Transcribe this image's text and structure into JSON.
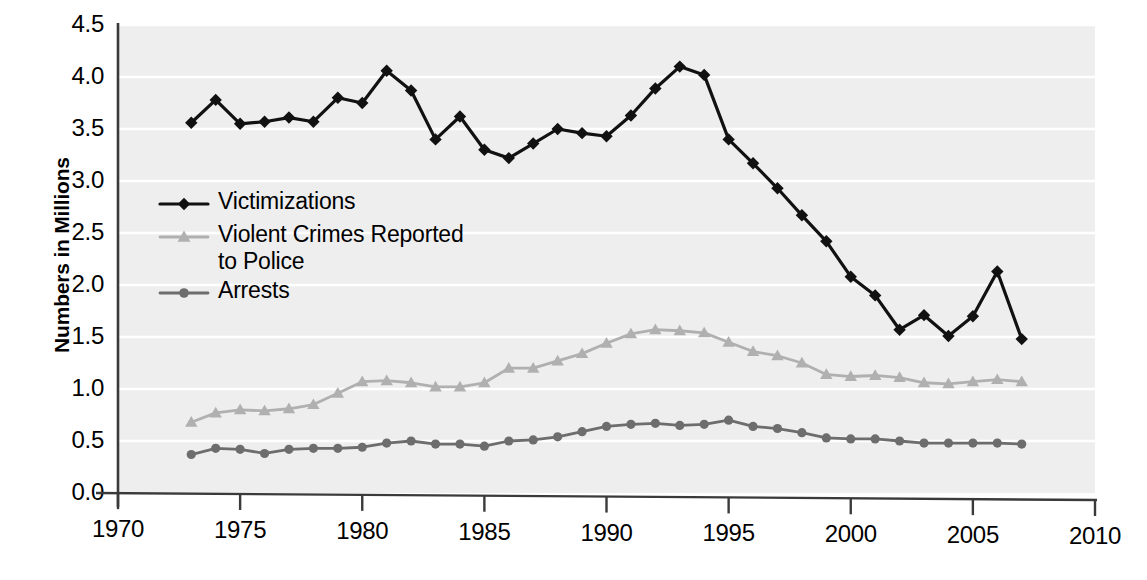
{
  "chart_data": {
    "type": "line",
    "title": "",
    "xlabel": "",
    "ylabel": "Numbers in Millions",
    "xlim": [
      1970,
      2010
    ],
    "ylim": [
      0.0,
      4.5
    ],
    "grid": true,
    "legend_position": "inside-left",
    "y_ticks": [
      "0.0",
      "0.5",
      "1.0",
      "1.5",
      "2.0",
      "2.5",
      "3.0",
      "3.5",
      "4.0",
      "4.5"
    ],
    "y_tick_values": [
      0.0,
      0.5,
      1.0,
      1.5,
      2.0,
      2.5,
      3.0,
      3.5,
      4.0,
      4.5
    ],
    "x_ticks": [
      "1970",
      "1975",
      "1980",
      "1985",
      "1990",
      "1995",
      "2000",
      "2005",
      "2010"
    ],
    "x_tick_values": [
      1970,
      1975,
      1980,
      1985,
      1990,
      1995,
      2000,
      2005,
      2010
    ],
    "x": [
      1973,
      1974,
      1975,
      1976,
      1977,
      1978,
      1979,
      1980,
      1981,
      1982,
      1983,
      1984,
      1985,
      1986,
      1987,
      1988,
      1989,
      1990,
      1991,
      1992,
      1993,
      1994,
      1995,
      1996,
      1997,
      1998,
      1999,
      2000,
      2001,
      2002,
      2003,
      2004,
      2005,
      2006,
      2007
    ],
    "series": [
      {
        "name": "Victimizations",
        "color": "#111111",
        "marker": "diamond",
        "values": [
          3.56,
          3.78,
          3.55,
          3.57,
          3.61,
          3.57,
          3.8,
          3.75,
          4.06,
          3.87,
          3.4,
          3.62,
          3.3,
          3.22,
          3.36,
          3.5,
          3.46,
          3.43,
          3.63,
          3.89,
          4.1,
          4.02,
          3.4,
          3.17,
          2.93,
          2.67,
          2.42,
          2.08,
          1.9,
          1.57,
          1.71,
          1.51,
          1.7,
          2.13,
          1.48
        ]
      },
      {
        "name": "Violent Crimes Reported\nto Police",
        "color": "#b0b0b0",
        "marker": "triangle",
        "values": [
          0.68,
          0.77,
          0.8,
          0.79,
          0.81,
          0.85,
          0.96,
          1.07,
          1.08,
          1.06,
          1.02,
          1.02,
          1.06,
          1.2,
          1.2,
          1.27,
          1.34,
          1.44,
          1.53,
          1.57,
          1.56,
          1.54,
          1.45,
          1.36,
          1.32,
          1.25,
          1.14,
          1.12,
          1.13,
          1.11,
          1.06,
          1.05,
          1.07,
          1.09,
          1.07
        ]
      },
      {
        "name": "Arrests",
        "color": "#6d6d6d",
        "marker": "circle",
        "values": [
          0.37,
          0.43,
          0.42,
          0.38,
          0.42,
          0.43,
          0.43,
          0.44,
          0.48,
          0.5,
          0.47,
          0.47,
          0.45,
          0.5,
          0.51,
          0.54,
          0.59,
          0.64,
          0.66,
          0.67,
          0.65,
          0.66,
          0.7,
          0.64,
          0.62,
          0.58,
          0.53,
          0.52,
          0.52,
          0.5,
          0.48,
          0.48,
          0.48,
          0.48,
          0.47
        ]
      }
    ]
  },
  "axis": {
    "y_title": "Numbers in Millions"
  },
  "legend": {
    "items": [
      {
        "label": "Victimizations",
        "color": "#111111",
        "marker": "diamond"
      },
      {
        "label": "Violent Crimes Reported\nto Police",
        "color": "#b0b0b0",
        "marker": "triangle"
      },
      {
        "label": "Arrests",
        "color": "#6d6d6d",
        "marker": "circle"
      }
    ]
  },
  "style": {
    "plot_background": "#eeeeee",
    "gridline_color": "#ffffff",
    "axis_color": "#3a3a3a",
    "text_color": "#000000"
  },
  "caption": {
    "text": ""
  }
}
